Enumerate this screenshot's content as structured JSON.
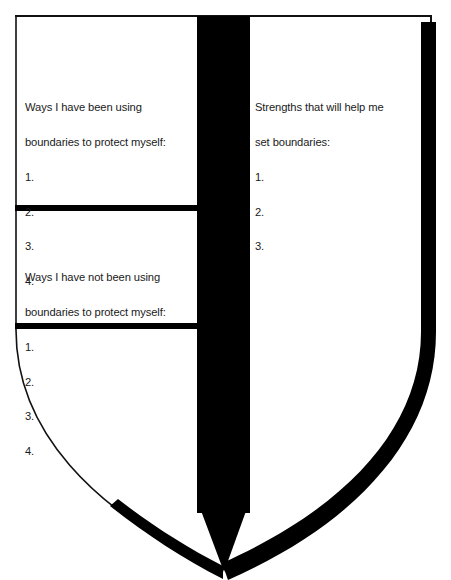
{
  "worksheet": {
    "title": "Boundaries Shield Worksheet",
    "shape": "shield",
    "colors": {
      "ink": "#000000",
      "paper": "#ffffff",
      "text": "#1a1a1a"
    },
    "panels": {
      "upper_left": {
        "heading_line1": "Ways I have been using",
        "heading_line2": "boundaries to protect myself:",
        "items": [
          "1.",
          "2.",
          "3.",
          "4."
        ]
      },
      "lower_left": {
        "heading_line1": "Ways I have not been using",
        "heading_line2": "boundaries to protect myself:",
        "items": [
          "1.",
          "2.",
          "3.",
          "4."
        ]
      },
      "right": {
        "heading_line1": "Strengths that will help me",
        "heading_line2": "set boundaries:",
        "items": [
          "1.",
          "2.",
          "3."
        ]
      }
    }
  }
}
